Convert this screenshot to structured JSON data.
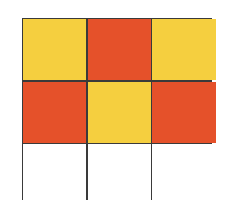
{
  "diagram": {
    "type": "grid",
    "rows": 3,
    "columns": 3,
    "colors": {
      "yellow": "#F5CF3F",
      "red": "#E5512A",
      "white": "#FFFFFF",
      "border": "#3A3A3A"
    },
    "cells": [
      [
        "yellow",
        "red",
        "yellow"
      ],
      [
        "red",
        "yellow",
        "red"
      ],
      [
        "white",
        "white",
        "white"
      ]
    ]
  }
}
